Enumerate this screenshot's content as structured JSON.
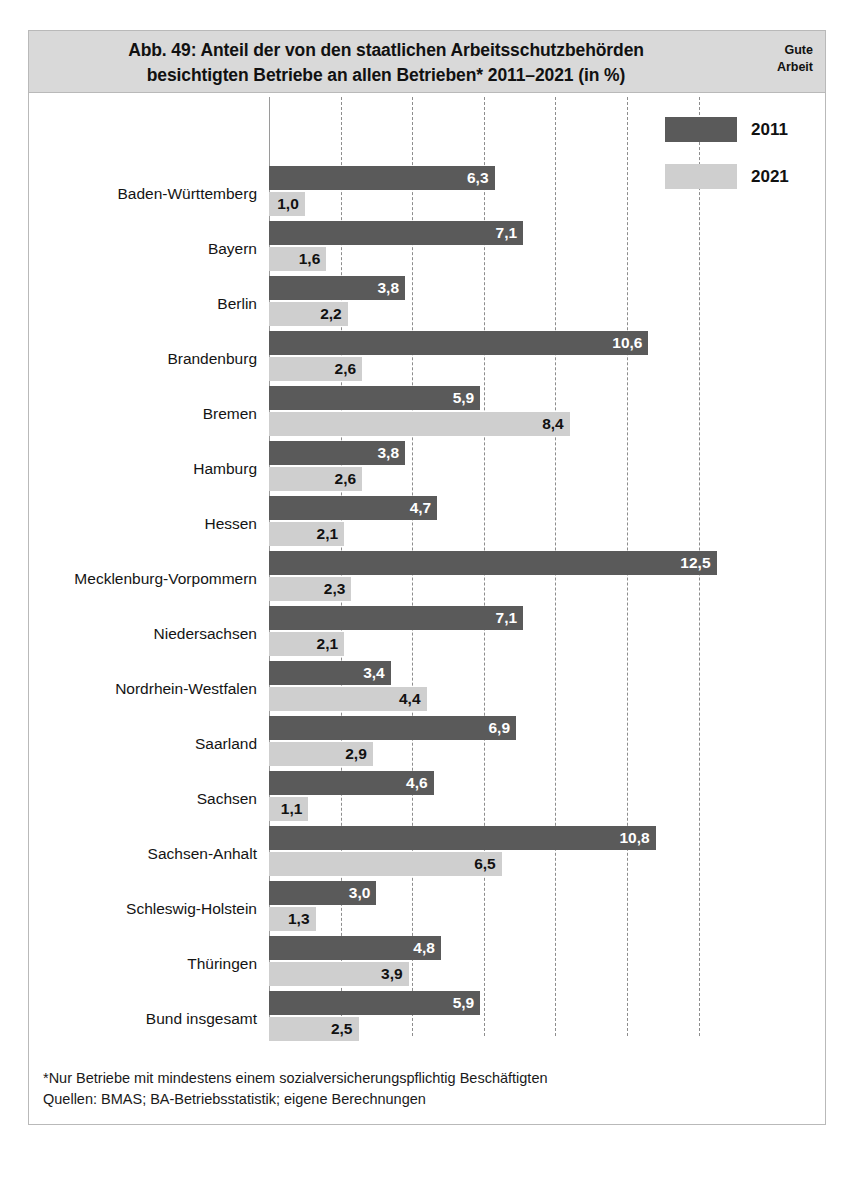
{
  "header": {
    "title_line1": "Abb. 49: Anteil der von den staatlichen Arbeitsschutzbehörden",
    "title_line2": "besichtigten Betriebe an allen Betrieben* 2011–2021 (in %)",
    "brand_line1": "Gute",
    "brand_line2": "Arbeit"
  },
  "legend": {
    "items": [
      {
        "label": "2011",
        "color": "#5a5a5a"
      },
      {
        "label": "2021",
        "color": "#cfcfcf"
      }
    ]
  },
  "footnotes": [
    "*Nur Betriebe mit mindestens einem sozialversicherungspflichtig Beschäftigten",
    "Quellen: BMAS; BA-Betriebsstatistik; eigene Berechnungen"
  ],
  "chart_data": {
    "type": "bar",
    "orientation": "horizontal",
    "title": "Abb. 49: Anteil der von den staatlichen Arbeitsschutzbehörden besichtigten Betriebe an allen Betrieben* 2011–2021 (in %)",
    "xlabel": "",
    "ylabel": "",
    "xlim": [
      0,
      13.6
    ],
    "grid": true,
    "gridlines": [
      2,
      4,
      6,
      8,
      10,
      12
    ],
    "legend_position": "top-right",
    "categories": [
      "Baden-Württemberg",
      "Bayern",
      "Berlin",
      "Brandenburg",
      "Bremen",
      "Hamburg",
      "Hessen",
      "Mecklenburg-Vorpommern",
      "Niedersachsen",
      "Nordrhein-Westfalen",
      "Saarland",
      "Sachsen",
      "Sachsen-Anhalt",
      "Schleswig-Holstein",
      "Thüringen",
      "Bund insgesamt"
    ],
    "series": [
      {
        "name": "2011",
        "color": "#5a5a5a",
        "values": [
          6.3,
          7.1,
          3.8,
          10.6,
          5.9,
          3.8,
          4.7,
          12.5,
          7.1,
          3.4,
          6.9,
          4.6,
          10.8,
          3.0,
          4.8,
          5.9
        ],
        "labels": [
          "6,3",
          "7,1",
          "3,8",
          "10,6",
          "5,9",
          "3,8",
          "4,7",
          "12,5",
          "7,1",
          "3,4",
          "6,9",
          "4,6",
          "10,8",
          "3,0",
          "4,8",
          "5,9"
        ]
      },
      {
        "name": "2021",
        "color": "#cfcfcf",
        "values": [
          1.0,
          1.6,
          2.2,
          2.6,
          8.4,
          2.6,
          2.1,
          2.3,
          2.1,
          4.4,
          2.9,
          1.1,
          6.5,
          1.3,
          3.9,
          2.5
        ],
        "labels": [
          "1,0",
          "1,6",
          "2,2",
          "2,6",
          "8,4",
          "2,6",
          "2,1",
          "2,3",
          "2,1",
          "4,4",
          "2,9",
          "1,1",
          "6,5",
          "1,3",
          "3,9",
          "2,5"
        ]
      }
    ]
  }
}
